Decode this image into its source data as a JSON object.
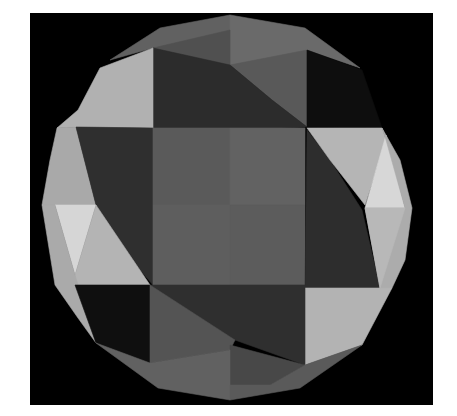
{
  "image": {
    "title": "Shaded geodesic polyhedron render",
    "background": "#ffffff",
    "frame": {
      "x": 30,
      "y": 13,
      "w": 403,
      "h": 392,
      "color": "#000000"
    }
  },
  "palette": {
    "darkest": "#101010",
    "dark": "#2e2e2e",
    "mid_dark": "#3c3c3c",
    "mid": "#555555",
    "mid_center": "#5e5e5e",
    "mid_light": "#6a6a6a",
    "light": "#a9a9a9",
    "lighter": "#bcbcbc",
    "lightest": "#d4d4d4"
  },
  "faces": [
    {
      "name": "top-band-left",
      "color": "#616161",
      "points": "110,60 160,28 230,15 230,65 153,48"
    },
    {
      "name": "top-band-right",
      "color": "#6a6a6a",
      "points": "230,15 305,28 360,68 307,50 307,65 230,65"
    },
    {
      "name": "top-center-left-dark",
      "color": "#505050",
      "points": "153,48 230,30 230,65"
    },
    {
      "name": "top-right-mid",
      "color": "#595959",
      "points": "230,65 307,50 307,127 272,100"
    },
    {
      "name": "top-left-dark",
      "color": "#2c2c2c",
      "points": "153,48 230,65 272,100 307,127 230,130 153,128"
    },
    {
      "name": "top-right-black",
      "color": "#0e0e0e",
      "points": "307,50 362,70 382,128 307,127"
    },
    {
      "name": "upper-left-light",
      "color": "#b1b1b1",
      "points": "153,48 100,68 78,110 57,128 76,127 153,128"
    },
    {
      "name": "left-edge-top-light",
      "color": "#a9a9a9",
      "points": "57,128 76,127 96,205 42,205 50,160"
    },
    {
      "name": "left-dark",
      "color": "#2f2f2f",
      "points": "76,127 153,128 153,285 140,270 96,205"
    },
    {
      "name": "left-lightest-tri",
      "color": "#d6d6d6",
      "points": "55,205 96,205 75,275"
    },
    {
      "name": "left-light-lower",
      "color": "#b4b4b4",
      "points": "96,205 150,285 75,285 75,275"
    },
    {
      "name": "left-edge-lower",
      "color": "#aaaaaa",
      "points": "42,205 55,205 75,275 96,343 78,318 55,285"
    },
    {
      "name": "lower-left-black",
      "color": "#0f0f0f",
      "points": "75,285 150,285 150,363 96,343"
    },
    {
      "name": "center-q1",
      "color": "#5a5a5a",
      "points": "153,128 230,128 230,205 153,205"
    },
    {
      "name": "center-q2",
      "color": "#626262",
      "points": "230,128 305,128 305,205 230,205"
    },
    {
      "name": "center-q3",
      "color": "#5e5e5e",
      "points": "153,205 230,205 230,285 153,285"
    },
    {
      "name": "center-q4",
      "color": "#5c5c5c",
      "points": "230,205 305,205 305,285 230,285"
    },
    {
      "name": "right-dark",
      "color": "#2d2d2d",
      "points": "307,130 330,160 362,210 380,288 305,288"
    },
    {
      "name": "right-light-upper",
      "color": "#b5b5b5",
      "points": "307,128 382,128 386,140 365,205 330,160"
    },
    {
      "name": "right-lightest-tri",
      "color": "#d7d7d7",
      "points": "386,135 405,208 365,208"
    },
    {
      "name": "right-edge",
      "color": "#acacac",
      "points": "382,128 400,160 412,208 405,260 392,288 380,288 365,208 405,208 386,140"
    },
    {
      "name": "right-light-lower",
      "color": "#b8b8b8",
      "points": "365,208 405,208 380,288"
    },
    {
      "name": "lower-right-light",
      "color": "#b3b3b3",
      "points": "305,288 392,288 362,345 305,365"
    },
    {
      "name": "bottom-center-dark",
      "color": "#2f2f2f",
      "points": "150,285 305,285 305,365 235,340 150,285"
    },
    {
      "name": "bottom-left-mid",
      "color": "#545454",
      "points": "150,285 235,340 230,350 150,363"
    },
    {
      "name": "bottom-center-mid",
      "color": "#484848",
      "points": "230,345 305,365 270,385 230,385"
    },
    {
      "name": "bottom-band-left",
      "color": "#616161",
      "points": "96,343 150,363 230,350 230,400 158,388"
    },
    {
      "name": "bottom-band-right",
      "color": "#5a5a5a",
      "points": "230,385 270,385 305,365 362,345 300,388 230,400"
    }
  ]
}
